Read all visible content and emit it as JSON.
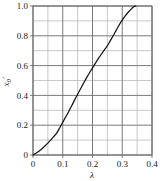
{
  "chart_data": {
    "type": "line",
    "title": "",
    "xlabel": "λ",
    "ylabel": "x₀′",
    "ylabel_base": "x",
    "ylabel_sub": "0",
    "ylabel_prime": "′",
    "xlim": [
      0,
      0.4
    ],
    "ylim": [
      0,
      1.0
    ],
    "grid": true,
    "grid_major_color": "#6b6b6b",
    "grid_minor_color": "#b0b0b0",
    "curve_color": "#141414",
    "frame_color": "#6b6b6b",
    "legend": null,
    "legend_position": "none",
    "xticks": [
      0,
      0.1,
      0.2,
      0.3,
      0.4
    ],
    "xtick_labels": [
      "0",
      "0.1",
      "0.2",
      "0.3",
      "0.4"
    ],
    "x_minor_step": 0.05,
    "yticks": [
      0,
      0.2,
      0.4,
      0.6,
      0.8,
      1.0
    ],
    "ytick_labels": [
      "0",
      "0.2",
      "0.4",
      "0.6",
      "0.8",
      "1.0"
    ],
    "y_minor_step": 0.1,
    "series": [
      {
        "name": "x0prime-vs-lambda",
        "x": [
          0.0,
          0.01,
          0.02,
          0.03,
          0.04,
          0.05,
          0.06,
          0.07,
          0.08,
          0.09,
          0.1,
          0.11,
          0.12,
          0.13,
          0.14,
          0.15,
          0.16,
          0.17,
          0.18,
          0.19,
          0.2,
          0.21,
          0.22,
          0.23,
          0.24,
          0.25,
          0.26,
          0.27,
          0.28,
          0.29,
          0.3,
          0.31,
          0.32,
          0.33,
          0.34,
          0.345
        ],
        "y": [
          0.0,
          0.012,
          0.026,
          0.042,
          0.06,
          0.08,
          0.101,
          0.124,
          0.148,
          0.183,
          0.22,
          0.255,
          0.292,
          0.33,
          0.37,
          0.408,
          0.445,
          0.482,
          0.518,
          0.552,
          0.585,
          0.617,
          0.648,
          0.678,
          0.706,
          0.733,
          0.768,
          0.802,
          0.838,
          0.874,
          0.905,
          0.933,
          0.958,
          0.979,
          0.996,
          1.0
        ]
      }
    ]
  },
  "plot_geometry": {
    "left": 33,
    "top": 6,
    "right": 152,
    "bottom": 155
  }
}
